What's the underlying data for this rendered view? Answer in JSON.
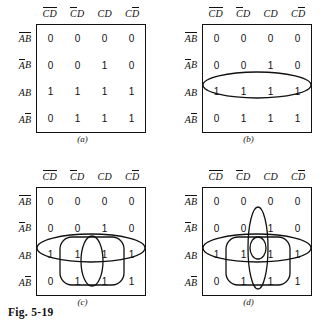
{
  "figure": {
    "caption": "Fig. 5-19"
  },
  "map": {
    "col_headers": [
      {
        "left": "C",
        "left_bar": true,
        "right": "D",
        "right_bar": true
      },
      {
        "left": "C",
        "left_bar": true,
        "right": "D",
        "right_bar": false
      },
      {
        "left": "C",
        "left_bar": false,
        "right": "D",
        "right_bar": false
      },
      {
        "left": "C",
        "left_bar": false,
        "right": "D",
        "right_bar": true
      }
    ],
    "row_headers": [
      {
        "left": "A",
        "left_bar": true,
        "right": "B",
        "right_bar": true
      },
      {
        "left": "A",
        "left_bar": true,
        "right": "B",
        "right_bar": false
      },
      {
        "left": "A",
        "left_bar": false,
        "right": "B",
        "right_bar": false
      },
      {
        "left": "A",
        "left_bar": false,
        "right": "B",
        "right_bar": true
      }
    ],
    "values": [
      [
        "0",
        "0",
        "0",
        "0"
      ],
      [
        "0",
        "0",
        "1",
        "0"
      ],
      [
        "1",
        "1",
        "1",
        "1"
      ],
      [
        "0",
        "1",
        "1",
        "1"
      ]
    ]
  },
  "panels": [
    {
      "id": "a",
      "label": "(a)",
      "loops": []
    },
    {
      "id": "b",
      "label": "(b)",
      "loops": [
        {
          "name": "loop-row-ab",
          "type": "ellipse",
          "cx": 91,
          "cy": 85,
          "rx": 54,
          "ry": 13
        }
      ]
    },
    {
      "id": "c",
      "label": "(c)",
      "loops": [
        {
          "name": "loop-row-ab",
          "type": "ellipse",
          "cx": 91,
          "cy": 85,
          "rx": 54,
          "ry": 14
        },
        {
          "name": "loop-cols-2-3-rows-3-4",
          "type": "rect",
          "x": 60,
          "y": 74,
          "w": 64,
          "h": 48,
          "r": 12
        },
        {
          "name": "loop-col-3-rows-3-4",
          "type": "ellipse",
          "cx": 92,
          "cy": 98,
          "rx": 11,
          "ry": 25
        }
      ]
    },
    {
      "id": "d",
      "label": "(d)",
      "loops": [
        {
          "name": "loop-col-3-rows-2-4",
          "type": "ellipse",
          "cx": 92,
          "cy": 85,
          "rx": 10,
          "ry": 41
        },
        {
          "name": "loop-row-ab",
          "type": "ellipse",
          "cx": 91,
          "cy": 85,
          "rx": 54,
          "ry": 14
        },
        {
          "name": "loop-cols-2-3-rows-3-4",
          "type": "rect",
          "x": 60,
          "y": 74,
          "w": 64,
          "h": 48,
          "r": 12
        },
        {
          "name": "loop-cell-ab-cd",
          "type": "ellipse",
          "cx": 92,
          "cy": 85,
          "rx": 8,
          "ry": 11
        }
      ]
    }
  ]
}
